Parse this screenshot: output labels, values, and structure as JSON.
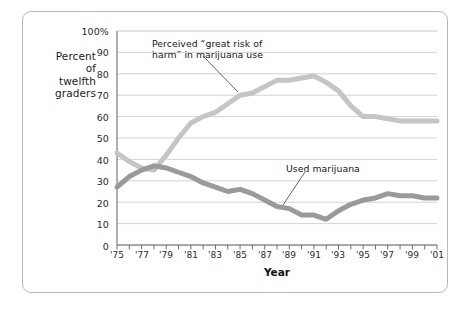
{
  "figure": {
    "frame_color": "#b9b9b9",
    "background": "#ffffff"
  },
  "axis": {
    "y_title_lines": [
      "Percent",
      "of",
      "twelfth",
      "graders"
    ],
    "y_ticks": [
      "0",
      "10",
      "20",
      "30",
      "40",
      "50",
      "60",
      "70",
      "80",
      "90",
      "100%"
    ],
    "x_title": "Year",
    "x_tick_labels": [
      "'75",
      "'77",
      "'79",
      "'81",
      "'83",
      "'85",
      "'87",
      "'89",
      "'91",
      "'93",
      "'95",
      "'97",
      "'99",
      "'01"
    ]
  },
  "annotations": {
    "risk": "Perceived “great risk of\nharm” in marijuana use",
    "use": "Used marijuana"
  },
  "chart_data": {
    "type": "line",
    "title": "",
    "subtitle": "",
    "xlabel": "Year",
    "ylabel": "Percent of twelfth graders",
    "xlim": [
      1975,
      2001
    ],
    "ylim": [
      0,
      100
    ],
    "grid": "horizontal",
    "legend": "annotations-inline",
    "x": [
      1975,
      1976,
      1977,
      1978,
      1979,
      1980,
      1981,
      1982,
      1983,
      1984,
      1985,
      1986,
      1987,
      1988,
      1989,
      1990,
      1991,
      1992,
      1993,
      1994,
      1995,
      1996,
      1997,
      1998,
      1999,
      2000,
      2001
    ],
    "x_tick_values": [
      1975,
      1977,
      1979,
      1981,
      1983,
      1985,
      1987,
      1989,
      1991,
      1993,
      1995,
      1997,
      1999,
      2001
    ],
    "y_tick_values": [
      0,
      10,
      20,
      30,
      40,
      50,
      60,
      70,
      80,
      90,
      100
    ],
    "series": [
      {
        "name": "Perceived “great risk of harm” in marijuana use",
        "color": "#c5c5c5",
        "width": 5,
        "values": [
          43,
          39,
          36,
          35,
          42,
          50,
          57,
          60,
          62,
          66,
          70,
          71,
          74,
          77,
          77,
          78,
          79,
          76,
          72,
          65,
          60,
          60,
          59,
          58,
          58,
          58,
          58
        ]
      },
      {
        "name": "Used marijuana",
        "color": "#9a9a9a",
        "width": 5,
        "values": [
          27,
          32,
          35,
          37,
          36,
          34,
          32,
          29,
          27,
          25,
          26,
          24,
          21,
          18,
          17,
          14,
          14,
          12,
          16,
          19,
          21,
          22,
          24,
          23,
          23,
          22,
          22
        ]
      }
    ]
  }
}
